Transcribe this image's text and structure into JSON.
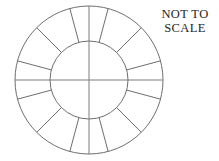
{
  "canvas": {
    "width": 219,
    "height": 161,
    "background_color": "#ffffff"
  },
  "annotation": {
    "line1": "NOT TO",
    "line2": "SCALE",
    "color": "#211f1f"
  },
  "figure": {
    "stroke_color": "#6e6e6e",
    "axis_stroke_color": "#7c7c7c",
    "stroke_width": 1,
    "fill": "none"
  },
  "chart_data": {
    "type": "pie",
    "title": "",
    "subtitle": "",
    "xlabel": "",
    "ylabel": "",
    "shape": "annulus",
    "center_x": 89,
    "center_y": 80,
    "outer_radius": 74,
    "inner_radius": 39,
    "segment_count": 12,
    "segment_angle_degrees": 30,
    "spoke_start_angle_degrees": 15,
    "categories": [
      "1",
      "2",
      "3",
      "4",
      "5",
      "6",
      "7",
      "8",
      "9",
      "10",
      "11",
      "12"
    ],
    "values": [
      30,
      30,
      30,
      30,
      30,
      30,
      30,
      30,
      30,
      30,
      30,
      30
    ],
    "spoke_angles_degrees": [
      15,
      45,
      75,
      105,
      135,
      165,
      195,
      225,
      255,
      285,
      315,
      345
    ],
    "axes": {
      "horizontal_diameter": true,
      "vertical_diameter": true,
      "grid": false
    },
    "legend": "none",
    "annotations": [
      "NOT TO",
      "SCALE"
    ]
  }
}
